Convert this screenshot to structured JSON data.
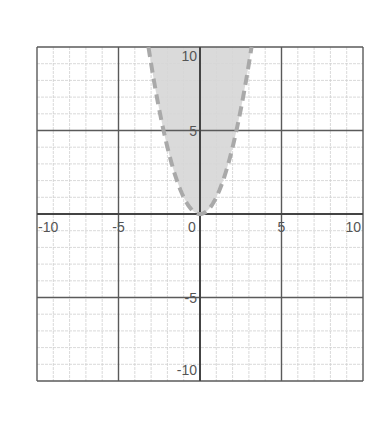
{
  "chart_data": {
    "type": "area",
    "title": "",
    "xlabel": "",
    "ylabel": "",
    "xlim": [
      -10,
      10
    ],
    "ylim": [
      -10,
      10
    ],
    "grid": true,
    "minor_grid_step": 1,
    "major_grid_step": 5,
    "x_tick_labels": [
      "-10",
      "-5",
      "0",
      "5",
      "10"
    ],
    "x_tick_values": [
      -10,
      -5,
      0,
      5,
      10
    ],
    "y_tick_labels": [
      "10",
      "5",
      "-5",
      "-10"
    ],
    "y_tick_values": [
      10,
      5,
      -5,
      -10
    ],
    "series": [
      {
        "name": "y > x^2",
        "kind": "inequality-region",
        "boundary": "y = x^2",
        "boundary_style": "dashed",
        "shaded": "above boundary (inside parabola)",
        "vertex": [
          0,
          0
        ],
        "points": [
          [
            -3.16,
            10
          ],
          [
            -3,
            9
          ],
          [
            -2,
            4
          ],
          [
            -1,
            1
          ],
          [
            0,
            0
          ],
          [
            1,
            1
          ],
          [
            2,
            4
          ],
          [
            3,
            9
          ],
          [
            3.16,
            10
          ]
        ]
      }
    ],
    "legend": null
  },
  "colors": {
    "fill": "#d6d6d6",
    "boundary": "#a9a9a9",
    "minor_grid": "#cfcfcf",
    "major_grid": "#5a5a5a",
    "axis": "#444444",
    "label": "#555555"
  }
}
